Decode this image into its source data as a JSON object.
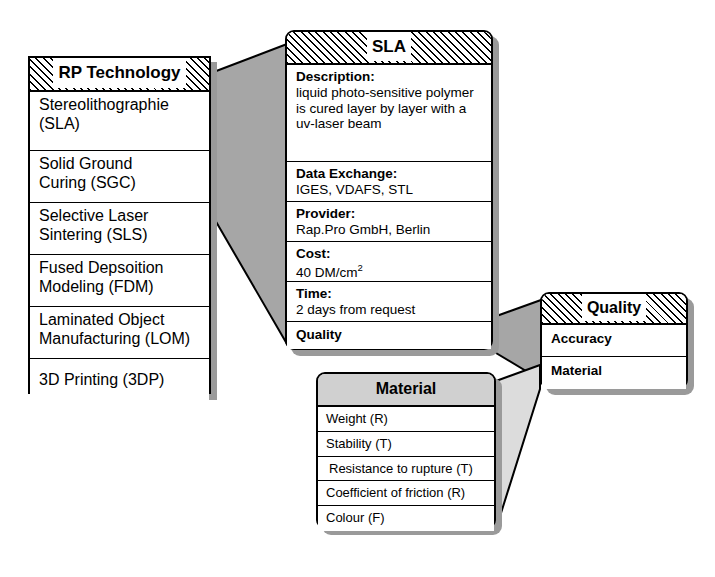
{
  "diagram": {
    "colors": {
      "shadow": "#9a9a9a",
      "connector_dark": "#a6a6a6",
      "connector_light": "#dcdcdc",
      "header_solid": "#d0d0d0",
      "line": "#000000",
      "background": "#ffffff"
    }
  },
  "rp_technology": {
    "header": "RP Technology",
    "header_style": "hatched",
    "items": [
      {
        "line1": "Stereolithographie",
        "line2": "(SLA)"
      },
      {
        "line1": "Solid Ground",
        "line2": "Curing (SGC)"
      },
      {
        "line1": "Selective Laser",
        "line2": "Sintering (SLS)"
      },
      {
        "line1": "Fused Depsoition",
        "line2": "Modeling (FDM)"
      },
      {
        "line1": "Laminated Object",
        "line2": "Manufacturing (LOM)"
      },
      {
        "line1": "3D Printing (3DP)",
        "line2": ""
      }
    ]
  },
  "sla": {
    "header": "SLA",
    "header_style": "hatched",
    "rows": [
      {
        "key": "Description:",
        "value_lines": [
          "liquid photo-sensitive polymer",
          "is cured layer by layer with a",
          "uv-laser beam"
        ]
      },
      {
        "key": "Data Exchange:",
        "value_lines": [
          "IGES, VDAFS, STL"
        ]
      },
      {
        "key": "Provider:",
        "value_lines": [
          "Rap.Pro GmbH, Berlin"
        ]
      },
      {
        "key": "Cost:",
        "value_lines": [
          "40 DM/cm"
        ],
        "superscript": "2"
      },
      {
        "key": "Time:",
        "value_lines": [
          "2 days from request"
        ]
      }
    ],
    "last_row": "Quality"
  },
  "quality": {
    "header": "Quality",
    "header_style": "hatched",
    "items": [
      "Accuracy",
      "Material"
    ]
  },
  "material": {
    "header": "Material",
    "header_style": "solid-gray",
    "items": [
      "Weight (R)",
      "Stability (T)",
      "Resistance to rupture (T)",
      "Coefficient of friction (R)",
      "Colour (F)"
    ]
  }
}
